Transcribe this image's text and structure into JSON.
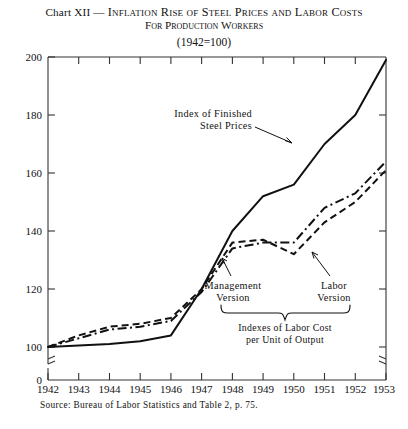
{
  "title": {
    "prefix": "Chart XII",
    "dash": " — ",
    "line1": "Inflation Rise of Steel Prices and Labor Costs",
    "line2": "For Production Workers",
    "subtitle": "(1942=100)"
  },
  "source": {
    "text": "Source: Bureau of Labor Statistics and Table 2, p. 75."
  },
  "annotations": {
    "steel_label_line1": "Index of Finished",
    "steel_label_line2": "Steel Prices",
    "management_line1": "Management",
    "management_line2": "Version",
    "labor_line1": "Labor",
    "labor_line2": "Version",
    "brace_line1": "Indexes of Labor Cost",
    "brace_line2": "per Unit of Output"
  },
  "axis": {
    "y_ticks": [
      "200",
      "180",
      "160",
      "140",
      "120",
      "100",
      "0"
    ],
    "x_ticks": [
      "1942",
      "1943",
      "1944",
      "1945",
      "1946",
      "1947",
      "1948",
      "1949",
      "1950",
      "1951",
      "1952",
      "1953"
    ],
    "y_min_plotted": 100,
    "y_max_plotted": 200,
    "y_break": true
  },
  "colors": {
    "ink": "#111111",
    "background": "#ffffff",
    "axis": "#555555"
  },
  "chart_data": {
    "type": "line",
    "title": "Chart XII — Inflation Rise of Steel Prices and Labor Costs For Production Workers",
    "subtitle": "(1942=100)",
    "xlabel": "",
    "ylabel": "",
    "x": [
      1942,
      1943,
      1944,
      1945,
      1946,
      1947,
      1948,
      1949,
      1950,
      1951,
      1952,
      1953
    ],
    "xlim": [
      1942,
      1953
    ],
    "ylim": [
      100,
      200
    ],
    "yticks": [
      100,
      120,
      140,
      160,
      180,
      200
    ],
    "grid": false,
    "legend": "annotations-inline",
    "series": [
      {
        "name": "Index of Finished Steel Prices",
        "style": "solid",
        "values": [
          100,
          100.5,
          101,
          102,
          104,
          120,
          140,
          152,
          156,
          170,
          180,
          199
        ]
      },
      {
        "name": "Management Version",
        "style": "dashed",
        "values": [
          100,
          104,
          107,
          108,
          110,
          120,
          136,
          137,
          132,
          143,
          150,
          161
        ]
      },
      {
        "name": "Labor Version",
        "style": "dash-dot",
        "values": [
          100,
          103,
          106,
          107,
          109,
          119,
          134,
          136,
          136,
          148,
          153,
          164
        ]
      }
    ]
  }
}
